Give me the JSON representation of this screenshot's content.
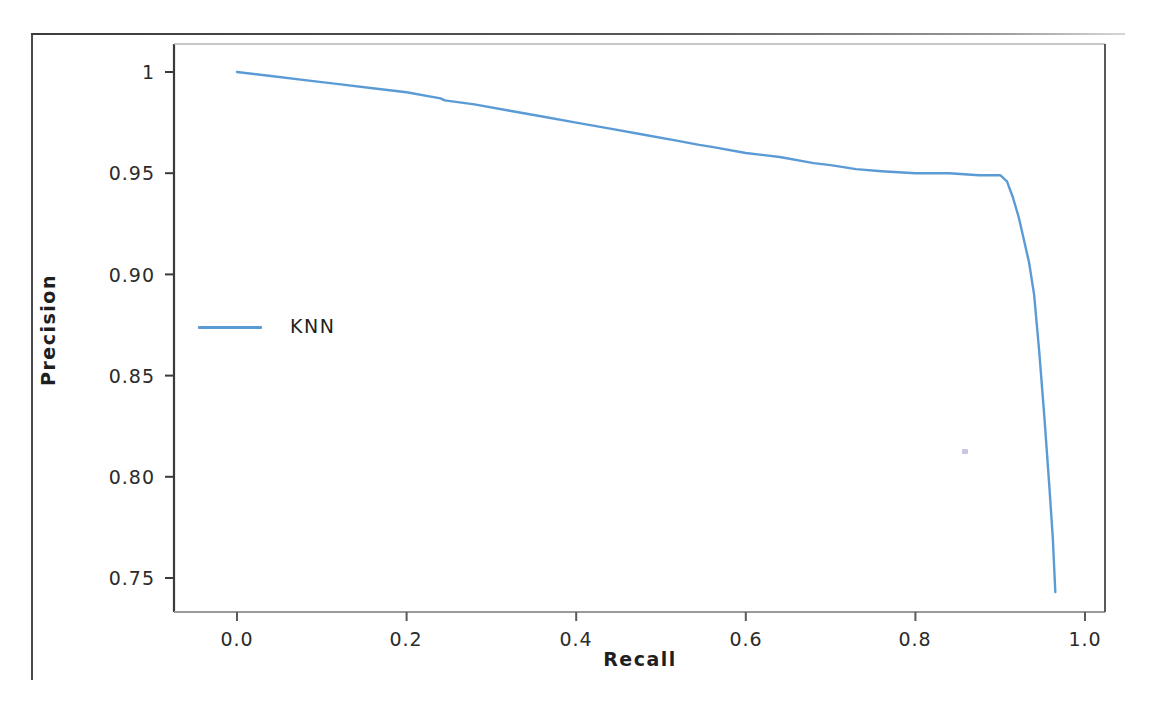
{
  "figure": {
    "caption_ghost": "",
    "background_color": "#ffffff",
    "frame_color": "#4a4a4a"
  },
  "legend": {
    "entries": [
      {
        "label": "KNN",
        "color": "#5b9bd5"
      }
    ],
    "position": "center-left"
  },
  "axes": {
    "x_title": "Recall",
    "y_title": "Precision",
    "x_ticks": [
      "0.0",
      "0.2",
      "0.4",
      "0.6",
      "0.8",
      "1.0"
    ],
    "y_ticks": [
      "0.75",
      "0.80",
      "0.85",
      "0.90",
      "0.95",
      "1.00"
    ]
  },
  "chart_data": {
    "type": "line",
    "title": "",
    "subtitle": "",
    "xlabel": "Recall",
    "ylabel": "Precision",
    "xlim": [
      0.0,
      1.0
    ],
    "ylim": [
      0.75,
      1.0
    ],
    "xticks": [
      0.0,
      0.2,
      0.4,
      0.6,
      0.8,
      1.0
    ],
    "yticks": [
      0.75,
      0.8,
      0.85,
      0.9,
      0.95,
      1.0
    ],
    "grid": false,
    "legend_position": "center-left",
    "annotations": [],
    "series": [
      {
        "name": "KNN",
        "color": "#5b9bd5",
        "linewidth": 2,
        "x": [
          0.0,
          0.04,
          0.08,
          0.12,
          0.16,
          0.2,
          0.24,
          0.245,
          0.28,
          0.32,
          0.36,
          0.4,
          0.44,
          0.48,
          0.52,
          0.545,
          0.56,
          0.6,
          0.64,
          0.68,
          0.7,
          0.715,
          0.73,
          0.76,
          0.8,
          0.84,
          0.875,
          0.9,
          0.908,
          0.915,
          0.922,
          0.928,
          0.934,
          0.94,
          0.946,
          0.952,
          0.958,
          0.962,
          0.965
        ],
        "y": [
          1.0,
          0.998,
          0.996,
          0.994,
          0.992,
          0.99,
          0.987,
          0.986,
          0.984,
          0.981,
          0.978,
          0.975,
          0.972,
          0.969,
          0.966,
          0.964,
          0.963,
          0.96,
          0.958,
          0.955,
          0.954,
          0.953,
          0.952,
          0.951,
          0.95,
          0.95,
          0.949,
          0.949,
          0.946,
          0.938,
          0.928,
          0.917,
          0.906,
          0.89,
          0.862,
          0.83,
          0.795,
          0.77,
          0.743
        ]
      }
    ]
  }
}
